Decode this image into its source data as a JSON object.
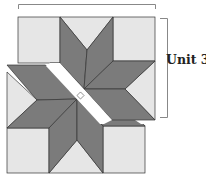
{
  "diagram": {
    "type": "quilt-block-assembly",
    "label": "Unit 3",
    "colors": {
      "dark_diamond": "#7b7b7b",
      "light_background": "#e6e6e6",
      "outline": "#333333",
      "bracket": "#888888",
      "gap": "#ffffff"
    },
    "units": [
      {
        "name": "upper-unit",
        "labeled": true
      },
      {
        "name": "lower-unit",
        "labeled": false
      }
    ]
  }
}
